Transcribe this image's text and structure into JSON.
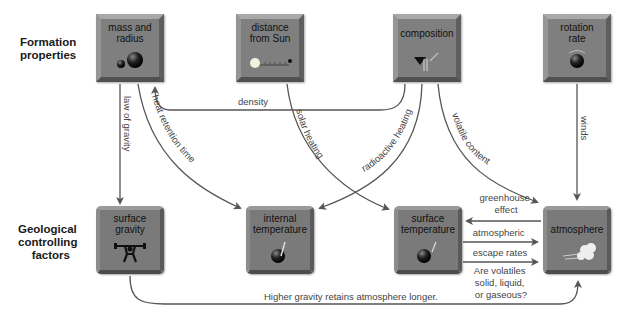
{
  "diagram": {
    "row_labels": {
      "top": [
        "Formation",
        "properties"
      ],
      "bottom": [
        "Geological",
        "controlling",
        "factors"
      ]
    },
    "formation_properties": [
      {
        "id": "mass",
        "label": [
          "mass and",
          "radius"
        ],
        "icon": "two-spheres-icon"
      },
      {
        "id": "distance",
        "label": [
          "distance",
          "from Sun"
        ],
        "icon": "sun-distance-ruler-icon"
      },
      {
        "id": "composition",
        "label": [
          "composition"
        ],
        "icon": "beaker-pour-icon"
      },
      {
        "id": "rotation",
        "label": [
          "rotation",
          "rate"
        ],
        "icon": "spinning-sphere-icon"
      }
    ],
    "controlling_factors": [
      {
        "id": "gravity",
        "label": [
          "surface",
          "gravity"
        ],
        "icon": "weightlifter-icon"
      },
      {
        "id": "internal_temp",
        "label": [
          "internal",
          "temperature"
        ],
        "icon": "sphere-thermometer-icon"
      },
      {
        "id": "surface_temp",
        "label": [
          "surface",
          "temperature"
        ],
        "icon": "sphere-thermometer-icon"
      },
      {
        "id": "atmosphere",
        "label": [
          "atmosphere"
        ],
        "icon": "cloud-icon"
      }
    ],
    "arrows": [
      {
        "from": "mass",
        "to": "gravity",
        "label": "law of gravity"
      },
      {
        "from": "mass",
        "to": "internal_temp",
        "label": "heat retention time"
      },
      {
        "from": "composition",
        "to": "mass",
        "label": "density"
      },
      {
        "from": "distance",
        "to": "surface_temp",
        "label": "solar heating"
      },
      {
        "from": "composition",
        "to": "internal_temp",
        "label": "radioactive heating"
      },
      {
        "from": "composition",
        "to": "atmosphere",
        "label": "volatile content"
      },
      {
        "from": "rotation",
        "to": "atmosphere",
        "label": "winds"
      },
      {
        "from": "atmosphere",
        "to": "surface_temp",
        "label": [
          "greenhouse",
          "effect"
        ]
      },
      {
        "from": "surface_temp",
        "to": "atmosphere",
        "label": [
          "atmospheric",
          "escape rates"
        ]
      },
      {
        "from": "surface_temp",
        "to": "atmosphere",
        "label": [
          "Are volatiles",
          "solid, liquid,",
          "or gaseous?"
        ]
      },
      {
        "from": "gravity",
        "to": "atmosphere",
        "label": "Higher gravity retains atmosphere longer."
      }
    ],
    "colors": {
      "box": "#7f7f7f",
      "arrow": "#555555",
      "text": "#444444"
    }
  }
}
